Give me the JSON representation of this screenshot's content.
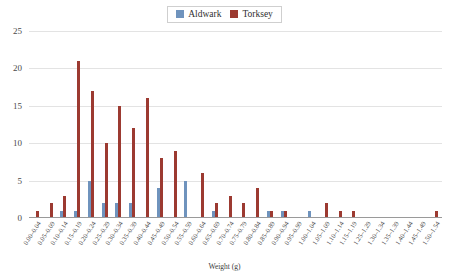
{
  "legend": {
    "position": "top-center",
    "entries": [
      {
        "label": "Aldwark",
        "color": "#6f93bd",
        "swatch_name": "legend-swatch-aldwark"
      },
      {
        "label": "Torksey",
        "color": "#9c3a31",
        "swatch_name": "legend-swatch-torksey"
      }
    ]
  },
  "axes": {
    "xlabel": "Weight (g)",
    "ylabel": "",
    "yticks": [
      "0",
      "5",
      "10",
      "15",
      "20",
      "25"
    ]
  },
  "chart_data": {
    "type": "bar",
    "title": "",
    "xlabel": "Weight (g)",
    "ylabel": "",
    "ylim": [
      0,
      25
    ],
    "ytick_step": 5,
    "grid": true,
    "legend_position": "top-center",
    "categories": [
      "0.00–0.04",
      "0.05–0.09",
      "0.10–0.14",
      "0.15–0.19",
      "0.20–0.24",
      "0.25–0.29",
      "0.30–0.34",
      "0.35–0.39",
      "0.40–0.44",
      "0.45–0.49",
      "0.50–0.54",
      "0.55–0.59",
      "0.60–0.64",
      "0.65–0.69",
      "0.70–0.74",
      "0.75–0.79",
      "0.80–0.84",
      "0.85–0.89",
      "0.90–0.94",
      "0.95–0.99",
      "1.00–1.04",
      "1.05–1.09",
      "1.10–1.14",
      "1.15–1.19",
      "1.25–1.29",
      "1.30–1.34",
      "1.35–1.39",
      "1.40–1.44",
      "1.45–1.49",
      "1.50–1.54"
    ],
    "series": [
      {
        "name": "Aldwark",
        "color": "#6f93bd",
        "values": [
          0,
          0,
          1,
          1,
          5,
          2,
          2,
          2,
          0,
          4,
          0,
          5,
          0,
          1,
          0,
          0,
          0,
          1,
          1,
          0,
          1,
          0,
          0,
          0,
          0,
          0,
          0,
          0,
          0,
          0
        ]
      },
      {
        "name": "Torksey",
        "color": "#9c3a31",
        "values": [
          1,
          2,
          3,
          21,
          17,
          10,
          15,
          12,
          16,
          8,
          9,
          0,
          6,
          2,
          3,
          2,
          4,
          1,
          1,
          0,
          0,
          2,
          1,
          1,
          0,
          0,
          0,
          0,
          0,
          1
        ]
      }
    ]
  }
}
